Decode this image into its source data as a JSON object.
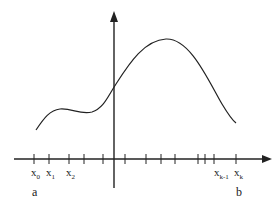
{
  "diagram": {
    "type": "function-partition",
    "stroke_color": "#222222",
    "x_axis": {
      "y": 159,
      "x_start": 14,
      "x_end": 272
    },
    "y_axis": {
      "x": 114,
      "y_top": 11,
      "y_bottom": 188
    },
    "tick_positions": [
      34,
      49,
      69,
      84,
      103,
      125,
      146,
      161,
      175,
      198,
      205,
      214,
      236
    ],
    "curve_path": "M36,130 C44,118 50,110 60,109 C72,108 80,115 92,112 C104,108 108,96 116,84 C130,62 145,40 166,39 C190,38 208,80 222,104 C228,114 232,120 236,123",
    "point_labels": [
      {
        "base": "x",
        "sub": "0",
        "x": 31
      },
      {
        "base": "x",
        "sub": "1",
        "x": 46
      },
      {
        "base": "x",
        "sub": "2",
        "x": 66
      },
      {
        "base": "x",
        "sub": "k-1",
        "x": 214
      },
      {
        "base": "x",
        "sub": "k",
        "x": 234
      }
    ],
    "endpoint_labels": [
      {
        "text": "a",
        "x": 32
      },
      {
        "text": "b",
        "x": 236
      }
    ]
  }
}
